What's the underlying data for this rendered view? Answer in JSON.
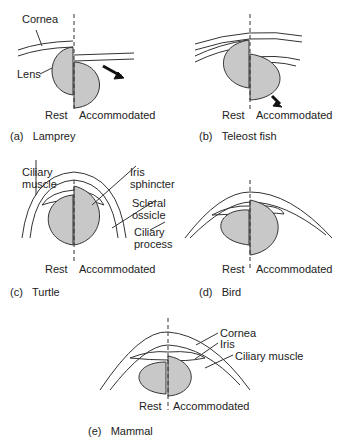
{
  "panels": {
    "a": {
      "caption_letter": "(a)",
      "caption_name": "Lamprey",
      "labels": {
        "cornea": "Cornea",
        "lens": "Lens"
      },
      "rest": "Rest",
      "accommodated": "Accommodated"
    },
    "b": {
      "caption_letter": "(b)",
      "caption_name": "Teleost fish",
      "rest": "Rest",
      "accommodated": "Accommodated"
    },
    "c": {
      "caption_letter": "(c)",
      "caption_name": "Turtle",
      "labels": {
        "ciliary_muscle_1": "Ciliary",
        "ciliary_muscle_2": "muscle",
        "iris_sphincter_1": "Iris",
        "iris_sphincter_2": "sphincter",
        "scleral_ossicle_1": "Scleral",
        "scleral_ossicle_2": "ossicle",
        "ciliary_process_1": "Ciliary",
        "ciliary_process_2": "process"
      },
      "rest": "Rest",
      "accommodated": "Accommodated"
    },
    "d": {
      "caption_letter": "(d)",
      "caption_name": "Bird",
      "rest": "Rest",
      "accommodated": "Accommodated"
    },
    "e": {
      "caption_letter": "(e)",
      "caption_name": "Mammal",
      "labels": {
        "cornea": "Cornea",
        "iris": "Iris",
        "ciliary_muscle": "Ciliary muscle"
      },
      "rest": "Rest",
      "accommodated": "Accommodated"
    }
  },
  "colors": {
    "lens_fill": "#c8c8c8",
    "stroke": "#333333"
  }
}
